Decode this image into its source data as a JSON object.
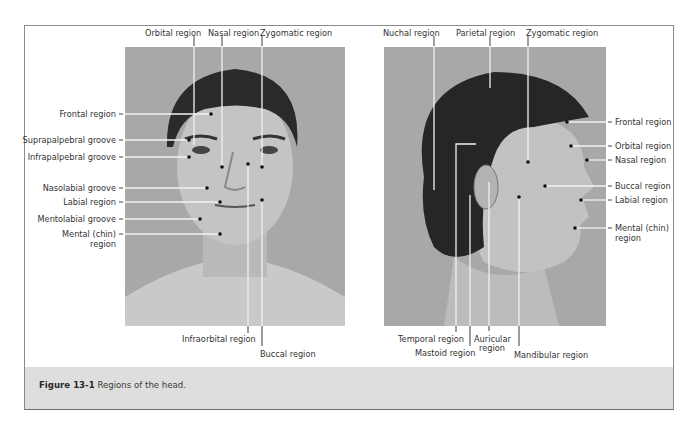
{
  "figure": {
    "number": "Figure 13-1",
    "title": "Regions of the head."
  },
  "frontal_view": {
    "top_labels": [
      "Orbital region",
      "Nasal region",
      "Zygomatic region"
    ],
    "left_labels": [
      "Frontal region",
      "Suprapalpebral groove",
      "Infrapalpebral groove",
      "Nasolabial groove",
      "Labial region",
      "Mentolabial groove",
      "Mental (chin)",
      "region"
    ],
    "bottom_labels": [
      "Infraorbital region",
      "Buccal region"
    ]
  },
  "lateral_view": {
    "top_labels": [
      "Nuchal region",
      "Parietal region",
      "Zygomatic region"
    ],
    "right_labels": [
      "Frontal region",
      "Orbital region",
      "Nasal region",
      "Buccal region",
      "Labial region",
      "Mental (chin)",
      "region"
    ],
    "bottom_labels": [
      "Temporal region",
      "Mastoid region",
      "Auricular",
      "region",
      "Mandibular region"
    ]
  },
  "colors": {
    "frame_border": "#8a8a8a",
    "caption_band": "#dedede",
    "photo_bg": "#a9a9a9",
    "leader_line": "#f2f2f2",
    "dot": "#111111"
  }
}
